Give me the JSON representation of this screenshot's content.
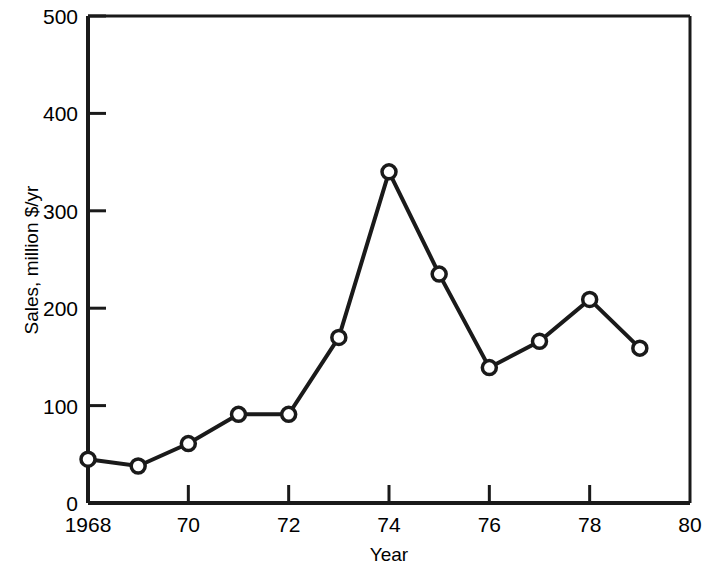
{
  "chart_data": {
    "type": "line",
    "title": "",
    "subtitle": "",
    "xlabel": "Year",
    "ylabel": "Sales, million $/yr",
    "xlim": [
      1968,
      1980
    ],
    "ylim": [
      0,
      500
    ],
    "grid": false,
    "legend": null,
    "x": [
      1968,
      1969,
      1970,
      1971,
      1972,
      1973,
      1974,
      1975,
      1976,
      1977,
      1978,
      1979
    ],
    "values": [
      45,
      38,
      61,
      91,
      91,
      170,
      340,
      235,
      139,
      166,
      209,
      159
    ],
    "series": [
      {
        "name": "Sales",
        "values": [
          45,
          38,
          61,
          91,
          91,
          170,
          340,
          235,
          139,
          166,
          209,
          159
        ]
      }
    ],
    "x_tick_values": [
      1968,
      1970,
      1972,
      1974,
      1976,
      1978,
      1980
    ],
    "x_tick_labels": [
      "1968",
      "70",
      "72",
      "74",
      "76",
      "78",
      "80"
    ],
    "y_tick_values": [
      0,
      100,
      200,
      300,
      400,
      500
    ],
    "y_tick_labels": [
      "0",
      "100",
      "200",
      "300",
      "400",
      "500"
    ],
    "marker": "open-circle",
    "line_color": "#1a1a1a",
    "marker_fill": "#ffffff",
    "marker_edge": "#1a1a1a",
    "background_color": "#ffffff"
  },
  "axes": {
    "y_title": "Sales, million $/yr",
    "x_title": "Year"
  }
}
